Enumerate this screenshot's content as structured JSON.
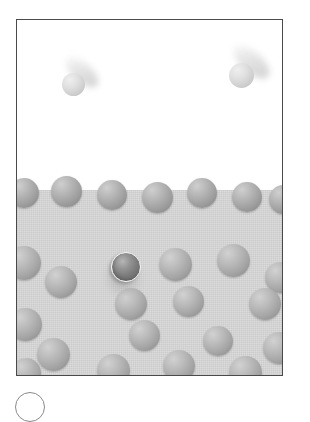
{
  "figure": {
    "caption_badge_label": "",
    "frame_color": "#4a4a4a",
    "vapor_color": "#ffffff",
    "liquid_color": "#dcdcdc",
    "molecule_color": "#a3a3a3",
    "highlighted_molecule_color": "#6a6a6a",
    "escaping_molecule_color": "#d8d8d8"
  },
  "regions": [
    {
      "name": "vapor-region",
      "label": "Vapor",
      "top": 0,
      "height": 172
    },
    {
      "name": "liquid-region",
      "label": "Liquid",
      "top": 170,
      "height": 187
    }
  ],
  "escaping_molecules": [
    {
      "id": "escaping-molecule-left",
      "x": 45,
      "y": 53,
      "size": 23,
      "trail_angle": 42,
      "trail_length": 40
    },
    {
      "id": "escaping-molecule-right",
      "x": 212,
      "y": 43,
      "size": 25,
      "trail_angle": 42,
      "trail_length": 44
    }
  ],
  "surface_molecules": [
    {
      "x": -8,
      "y": 158,
      "size": 30
    },
    {
      "x": 34,
      "y": 156,
      "size": 31
    },
    {
      "x": 80,
      "y": 160,
      "size": 30
    },
    {
      "x": 125,
      "y": 162,
      "size": 31
    },
    {
      "x": 170,
      "y": 158,
      "size": 30
    },
    {
      "x": 215,
      "y": 162,
      "size": 30
    },
    {
      "x": 252,
      "y": 165,
      "size": 29
    }
  ],
  "liquid_molecules": [
    {
      "x": -10,
      "y": 226,
      "size": 34
    },
    {
      "x": 28,
      "y": 246,
      "size": 32
    },
    {
      "x": 142,
      "y": 228,
      "size": 33
    },
    {
      "x": 200,
      "y": 224,
      "size": 33
    },
    {
      "x": 248,
      "y": 242,
      "size": 31
    },
    {
      "x": -8,
      "y": 288,
      "size": 33
    },
    {
      "x": 98,
      "y": 268,
      "size": 32
    },
    {
      "x": 156,
      "y": 266,
      "size": 31
    },
    {
      "x": 232,
      "y": 268,
      "size": 32
    },
    {
      "x": 20,
      "y": 318,
      "size": 33
    },
    {
      "x": 112,
      "y": 300,
      "size": 31
    },
    {
      "x": 186,
      "y": 306,
      "size": 30
    },
    {
      "x": 246,
      "y": 312,
      "size": 32
    },
    {
      "x": -6,
      "y": 338,
      "size": 30
    },
    {
      "x": 80,
      "y": 334,
      "size": 33
    },
    {
      "x": 146,
      "y": 330,
      "size": 32
    },
    {
      "x": 212,
      "y": 336,
      "size": 33
    }
  ],
  "highlighted_molecule": {
    "id": "molecule-highlighted",
    "x": 94,
    "y": 232,
    "size": 30,
    "description": "molecule with specular highlight below the surface"
  }
}
